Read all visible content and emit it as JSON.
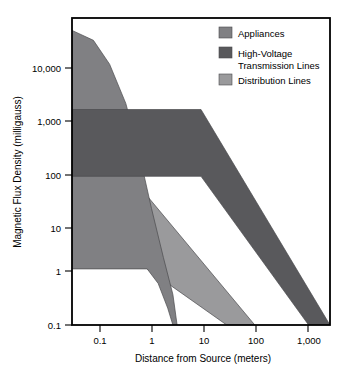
{
  "chart_data": {
    "type": "area",
    "title": "",
    "xlabel": "Distance from Source (meters)",
    "ylabel": "Magnetic Flux Density (milligauss)",
    "xscale": "log",
    "yscale": "log",
    "xlim": [
      0.04,
      2500
    ],
    "ylim": [
      0.1,
      30000
    ],
    "xticks": [
      "0.1",
      "1",
      "10",
      "100",
      "1,000"
    ],
    "xtick_values": [
      0.1,
      1,
      10,
      100,
      1000
    ],
    "yticks": [
      "0.1",
      "1",
      "10",
      "100",
      "1,000",
      "10,000"
    ],
    "ytick_values": [
      0.1,
      1,
      10,
      100,
      1000,
      10000
    ],
    "grid": false,
    "legend_position": "top-right inside",
    "series": [
      {
        "name": "Appliances",
        "color": "#808083",
        "upper_bound": [
          {
            "x": 0.04,
            "y": 18000
          },
          {
            "x": 0.1,
            "y": 12000
          },
          {
            "x": 0.2,
            "y": 4500
          },
          {
            "x": 0.4,
            "y": 900
          },
          {
            "x": 0.7,
            "y": 120
          },
          {
            "x": 1.2,
            "y": 12
          },
          {
            "x": 2.0,
            "y": 1.6
          },
          {
            "x": 3.0,
            "y": 0.35
          },
          {
            "x": 3.6,
            "y": 0.1
          }
        ],
        "lower_bound": [
          {
            "x": 0.04,
            "y": 1.0
          },
          {
            "x": 1.0,
            "y": 1.0
          },
          {
            "x": 1.6,
            "y": 0.55
          },
          {
            "x": 2.4,
            "y": 0.2
          },
          {
            "x": 3.0,
            "y": 0.1
          }
        ]
      },
      {
        "name": "High-Voltage Transmission Lines",
        "color": "#59595c",
        "upper_bound": [
          {
            "x": 0.04,
            "y": 700
          },
          {
            "x": 10,
            "y": 700
          },
          {
            "x": 2500,
            "y": 0.1
          }
        ],
        "lower_bound": [
          {
            "x": 0.04,
            "y": 45
          },
          {
            "x": 10,
            "y": 45
          },
          {
            "x": 1000,
            "y": 0.1
          }
        ]
      },
      {
        "name": "Distribution Lines",
        "color": "#9a9a9c",
        "upper_bound": [
          {
            "x": 0.04,
            "y": 30
          },
          {
            "x": 0.6,
            "y": 30
          },
          {
            "x": 1.0,
            "y": 20
          },
          {
            "x": 100,
            "y": 0.1
          }
        ],
        "lower_bound": [
          {
            "x": 0.04,
            "y": 7
          },
          {
            "x": 0.15,
            "y": 5.5
          },
          {
            "x": 0.35,
            "y": 3.0
          },
          {
            "x": 0.7,
            "y": 1.6
          },
          {
            "x": 1.0,
            "y": 1.0
          },
          {
            "x": 30,
            "y": 0.1
          }
        ]
      }
    ]
  },
  "axes": {
    "y_title": "Magnetic Flux Density (milligauss)",
    "x_title": "Distance from Source (meters)",
    "y_labels": [
      "10,000",
      "1,000",
      "100",
      "10",
      "1",
      "0.1"
    ],
    "x_labels": [
      "0.1",
      "1",
      "10",
      "100",
      "1,000"
    ]
  },
  "legend": {
    "items": [
      {
        "label": "Appliances",
        "color": "#808083",
        "swatch": "legend-swatch-appliances"
      },
      {
        "label": "High-Voltage",
        "label2": "Transmission Lines",
        "color": "#59595c",
        "swatch": "legend-swatch-high-voltage"
      },
      {
        "label": "Distribution Lines",
        "color": "#9a9a9c",
        "swatch": "legend-swatch-distribution"
      }
    ]
  },
  "colors": {
    "appliances": "#808083",
    "high_voltage": "#59595c",
    "distribution": "#9a9a9c",
    "frame": "#000000",
    "background": "#ffffff"
  }
}
